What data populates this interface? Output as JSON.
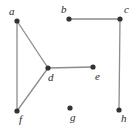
{
  "figure": {
    "type": "undirected-graph-diagram",
    "width": 137,
    "height": 130,
    "background_color": "#ffffff",
    "vertex_color": "#333333",
    "vertex_radius": 2.6,
    "edge_color": "#8c8c8c",
    "edge_width": 1.3,
    "label_color": "#2b2b2b",
    "label_style": "italic-serif",
    "label_font_size": 11
  },
  "chart_data": {
    "type": "diagram",
    "title": "",
    "nodes": [
      {
        "id": "a",
        "label": "a",
        "x": 17,
        "y": 21,
        "label_x": 9,
        "label_y": 6
      },
      {
        "id": "b",
        "label": "b",
        "x": 69,
        "y": 19,
        "label_x": 61,
        "label_y": 4
      },
      {
        "id": "c",
        "label": "c",
        "x": 120,
        "y": 19,
        "label_x": 124,
        "label_y": 4
      },
      {
        "id": "d",
        "label": "d",
        "x": 48,
        "y": 68,
        "label_x": 48,
        "label_y": 72
      },
      {
        "id": "e",
        "label": "e",
        "x": 93,
        "y": 67,
        "label_x": 95,
        "label_y": 71
      },
      {
        "id": "f",
        "label": "f",
        "x": 17,
        "y": 111,
        "label_x": 19,
        "label_y": 114
      },
      {
        "id": "g",
        "label": "g",
        "x": 70,
        "y": 108,
        "label_x": 70,
        "label_y": 112
      },
      {
        "id": "h",
        "label": "h",
        "x": 119,
        "y": 110,
        "label_x": 121,
        "label_y": 113
      }
    ],
    "edges": [
      {
        "source": "a",
        "target": "d"
      },
      {
        "source": "a",
        "target": "f"
      },
      {
        "source": "d",
        "target": "f"
      },
      {
        "source": "d",
        "target": "e"
      },
      {
        "source": "b",
        "target": "c"
      },
      {
        "source": "c",
        "target": "h"
      }
    ],
    "isolated_nodes": [
      "g"
    ],
    "node_count": 8,
    "edge_count": 6
  }
}
